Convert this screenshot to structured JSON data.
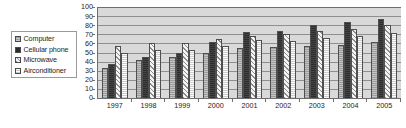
{
  "chart_data": {
    "type": "bar",
    "title": "",
    "xlabel": "",
    "ylabel": "",
    "ylim": [
      0,
      100
    ],
    "y_ticks": [
      0,
      10,
      20,
      30,
      40,
      50,
      60,
      70,
      80,
      90,
      100
    ],
    "grid": true,
    "legend_position": "left-outside",
    "categories": [
      "1997",
      "1998",
      "1999",
      "2000",
      "2001",
      "2002",
      "2003",
      "2004",
      "2005"
    ],
    "series": [
      {
        "name": "Computer",
        "pattern": "gray-solid",
        "values": [
          33,
          42,
          45,
          50,
          55,
          56,
          57,
          58,
          62
        ]
      },
      {
        "name": "Cellular phone",
        "pattern": "black-solid",
        "values": [
          37,
          45,
          50,
          62,
          72,
          74,
          80,
          84,
          87
        ]
      },
      {
        "name": "Microwave",
        "pattern": "diagonal-hatch",
        "values": [
          57,
          60,
          61,
          65,
          68,
          70,
          74,
          76,
          80
        ]
      },
      {
        "name": "Airconditioner",
        "pattern": "white-open",
        "values": [
          50,
          53,
          53,
          57,
          64,
          63,
          66,
          68,
          71
        ]
      }
    ]
  },
  "legend": {
    "items": [
      {
        "label": "Computer",
        "swatch": "sw-computer",
        "icon": "legend-swatch-icon"
      },
      {
        "label": "Cellular phone",
        "swatch": "sw-cellular",
        "icon": "legend-swatch-icon"
      },
      {
        "label": "Microwave",
        "swatch": "sw-microwave",
        "icon": "legend-swatch-icon"
      },
      {
        "label": "Airconditioner",
        "swatch": "sw-aircon",
        "icon": "legend-swatch-icon"
      }
    ]
  },
  "colors": {
    "plot_background": "#d9d9d9",
    "gridline": "#8e8e8e",
    "axis": "#6e6e6e",
    "text": "#1d1d1d",
    "computer": "#9c9c9c",
    "cellular_phone": "#2e2e2e",
    "microwave": "#f4f4f4",
    "airconditioner": "#fcfcfc"
  }
}
